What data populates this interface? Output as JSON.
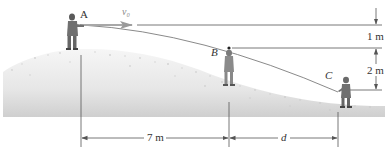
{
  "diagram": {
    "type": "projectile-motion-figure",
    "points": {
      "A": {
        "label": "A",
        "description": "thrower on hilltop"
      },
      "B": {
        "label": "B",
        "description": "catcher on slope"
      },
      "C": {
        "label": "C",
        "description": "catcher further down slope"
      }
    },
    "velocity_label": "v₀",
    "vertical_dimensions": {
      "top_to_B": "1 m",
      "B_to_C": "2 m"
    },
    "horizontal_dimensions": {
      "A_to_B": "7 m",
      "B_to_C": "d"
    },
    "colors": {
      "snow_light": "#f4f4f4",
      "snow_dark": "#d4d4d4",
      "line": "#555555",
      "trajectory": "#8a8a8a",
      "figure": "#6b6b6b"
    }
  }
}
